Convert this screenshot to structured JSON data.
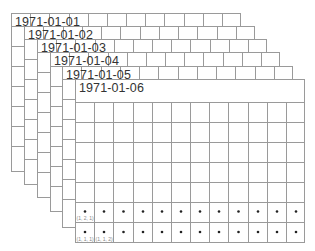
{
  "diagram": {
    "type": "stacked-calendar-grids",
    "line_color": "#9a9a9a",
    "dot_color": "#222222",
    "label_color": "#888888",
    "title_color": "#333333",
    "columns": 12,
    "layers": [
      {
        "title": "1971-01-01",
        "x": 11,
        "y": 13,
        "w": 230,
        "h": 159,
        "rows": [
          13,
          20,
          20,
          20,
          20,
          20,
          20,
          26
        ]
      },
      {
        "title": "1971-01-02",
        "x": 24,
        "y": 26,
        "w": 231,
        "h": 159,
        "rows": [
          13,
          20,
          20,
          20,
          20,
          20,
          20,
          26
        ]
      },
      {
        "title": "1971-01-03",
        "x": 37,
        "y": 39,
        "w": 230,
        "h": 159,
        "rows": [
          13,
          20,
          20,
          20,
          20,
          20,
          20,
          26
        ]
      },
      {
        "title": "1971-01-04",
        "x": 50,
        "y": 52,
        "w": 230,
        "h": 160,
        "rows": [
          14,
          20,
          20,
          20,
          20,
          20,
          20,
          26
        ]
      },
      {
        "title": "1971-01-05",
        "x": 62,
        "y": 66,
        "w": 231,
        "h": 162,
        "rows": [
          13,
          20,
          20,
          20,
          20,
          20,
          20,
          29
        ]
      },
      {
        "title": "1971-01-06",
        "x": 75,
        "y": 79,
        "w": 230,
        "h": 164,
        "rows": [
          23,
          20,
          20,
          20,
          20,
          20,
          20,
          21
        ]
      }
    ],
    "front_dot_rows": [
      6,
      7
    ],
    "cell_labels": [
      {
        "text": "(1, 2, 1)",
        "row": 6,
        "col": 0
      },
      {
        "text": "(1, 1, 1)",
        "row": 7,
        "col": 0
      },
      {
        "text": "(1, 1, 2)",
        "row": 7,
        "col": 1
      }
    ]
  }
}
